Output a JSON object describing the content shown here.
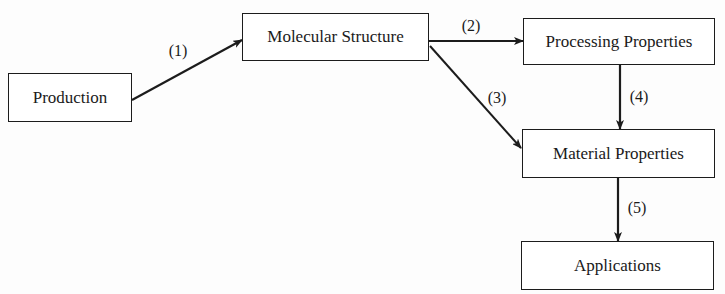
{
  "diagram": {
    "type": "flowchart",
    "nodes": [
      {
        "id": "production",
        "label": "Production"
      },
      {
        "id": "molecular_structure",
        "label": "Molecular Structure"
      },
      {
        "id": "processing_properties",
        "label": "Processing Properties"
      },
      {
        "id": "material_properties",
        "label": "Material Properties"
      },
      {
        "id": "applications",
        "label": "Applications"
      }
    ],
    "edges": [
      {
        "from": "production",
        "to": "molecular_structure",
        "label": "(1)"
      },
      {
        "from": "molecular_structure",
        "to": "processing_properties",
        "label": "(2)"
      },
      {
        "from": "molecular_structure",
        "to": "material_properties",
        "label": "(3)"
      },
      {
        "from": "processing_properties",
        "to": "material_properties",
        "label": "(4)"
      },
      {
        "from": "material_properties",
        "to": "applications",
        "label": "(5)"
      }
    ]
  },
  "colors": {
    "line": "#1c1c1c",
    "background": "#fdfdfd"
  }
}
